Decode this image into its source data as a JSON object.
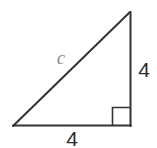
{
  "figure": {
    "type": "right-triangle-diagram",
    "background_color": "#ffffff",
    "width": 157,
    "height": 148,
    "stroke_color": "#333333",
    "stroke_width": 2,
    "labels": {
      "hypotenuse": "c",
      "vertical_leg": "4",
      "horizontal_leg": "4"
    },
    "label_colors": {
      "hypotenuse": "#8a8a8a",
      "vertical_leg": "#2b2b2b",
      "horizontal_leg": "#2b2b2b"
    },
    "geometry": {
      "left_vertex": "13,126",
      "top_vertex": "130,12",
      "right_vertex": "130,126",
      "right_angle_marker_size": 18,
      "right_angle_at": "right_vertex"
    }
  }
}
